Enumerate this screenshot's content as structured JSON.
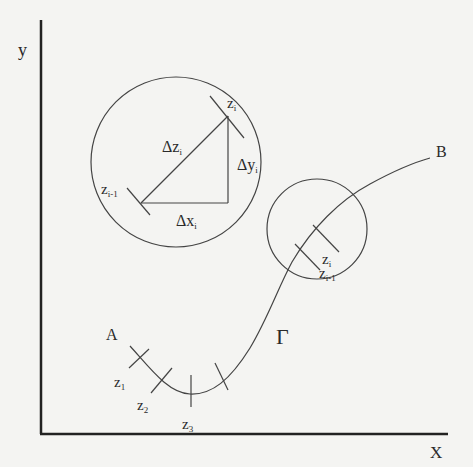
{
  "diagram": {
    "axes": {
      "y_label": "y",
      "x_label": "X"
    },
    "curve": {
      "name": "Γ",
      "start": "A",
      "end": "B"
    },
    "magnified_segment": {
      "dz": "Δz",
      "dz_sub": "i",
      "dx": "Δx",
      "dx_sub": "i",
      "dy": "Δy",
      "dy_sub": "i",
      "zi": "z",
      "zi_sub": "i",
      "zim1": "z",
      "zim1_sub": "i-1"
    },
    "small_circle": {
      "zi": "z",
      "zi_sub": "i",
      "zim1": "z",
      "zim1_sub": "i-1"
    },
    "points": [
      {
        "base": "z",
        "sub": "1"
      },
      {
        "base": "z",
        "sub": "2"
      },
      {
        "base": "z",
        "sub": "3"
      }
    ],
    "colors": {
      "stroke": "#3a3a3a",
      "background": "#f4f4f2"
    }
  }
}
